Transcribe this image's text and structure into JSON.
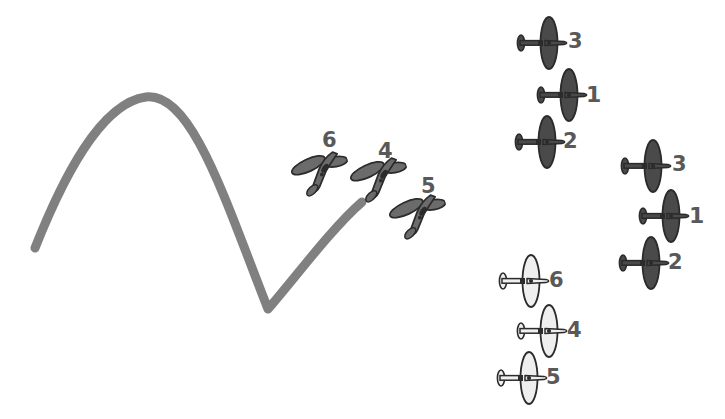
{
  "figure": {
    "background_color": "#ffffff",
    "width": 725,
    "height": 419
  },
  "curve": {
    "name": "flight-path-curve",
    "color": "#808080",
    "stroke_width": 9,
    "shape": "sine-wave",
    "path": "M 35 248 C 62 180, 100 103, 146 97 C 192 92, 225 200, 268 309 C 295 278, 332 228, 362 202"
  },
  "clusters": [
    {
      "id": "left-formation",
      "name": "left-formation",
      "style": "three-quarter-view",
      "fill": "#6b6b6b",
      "planes": [
        {
          "label": "6",
          "x": 320,
          "y": 172,
          "scale": 1.0,
          "rotation": -18,
          "label_x": 322,
          "label_y": 130
        },
        {
          "label": "4",
          "x": 379,
          "y": 178,
          "scale": 1.0,
          "rotation": -18,
          "label_x": 378,
          "label_y": 141
        },
        {
          "label": "5",
          "x": 418,
          "y": 215,
          "scale": 1.0,
          "rotation": -18,
          "label_x": 421,
          "label_y": 176
        }
      ]
    },
    {
      "id": "right-upper-formation",
      "name": "right-upper-formation",
      "style": "top-view-dark",
      "fill": "#4a4a4a",
      "planes": [
        {
          "label": "3",
          "x": 543,
          "y": 43,
          "scale": 1.0,
          "label_x": 568,
          "label_y": 31
        },
        {
          "label": "1",
          "x": 563,
          "y": 95,
          "scale": 1.0,
          "label_x": 586,
          "label_y": 84
        },
        {
          "label": "2",
          "x": 541,
          "y": 142,
          "scale": 1.0,
          "label_x": 563,
          "label_y": 131
        }
      ]
    },
    {
      "id": "right-lower-formation",
      "name": "right-lower-formation",
      "style": "top-view-dark",
      "fill": "#4a4a4a",
      "planes": [
        {
          "label": "3",
          "x": 647,
          "y": 166,
          "scale": 1.0,
          "label_x": 672,
          "label_y": 154
        },
        {
          "label": "1",
          "x": 665,
          "y": 216,
          "scale": 1.0,
          "label_x": 689,
          "label_y": 205
        },
        {
          "label": "2",
          "x": 645,
          "y": 263,
          "scale": 1.0,
          "label_x": 668,
          "label_y": 252
        }
      ]
    },
    {
      "id": "center-lower-formation",
      "name": "center-lower-formation",
      "style": "top-view-light",
      "fill": "#efefef",
      "planes": [
        {
          "label": "6",
          "x": 525,
          "y": 281,
          "scale": 1.0,
          "label_x": 549,
          "label_y": 270
        },
        {
          "label": "4",
          "x": 543,
          "y": 331,
          "scale": 1.0,
          "label_x": 567,
          "label_y": 320
        },
        {
          "label": "5",
          "x": 523,
          "y": 378,
          "scale": 1.0,
          "label_x": 546,
          "label_y": 367
        }
      ]
    }
  ],
  "colors": {
    "label_text": "#595959",
    "curve_gray": "#808080",
    "plane_dark": "#4a4a4a",
    "plane_mid": "#6b6b6b",
    "plane_light": "#efefef",
    "plane_outline": "#2b2b2b"
  }
}
